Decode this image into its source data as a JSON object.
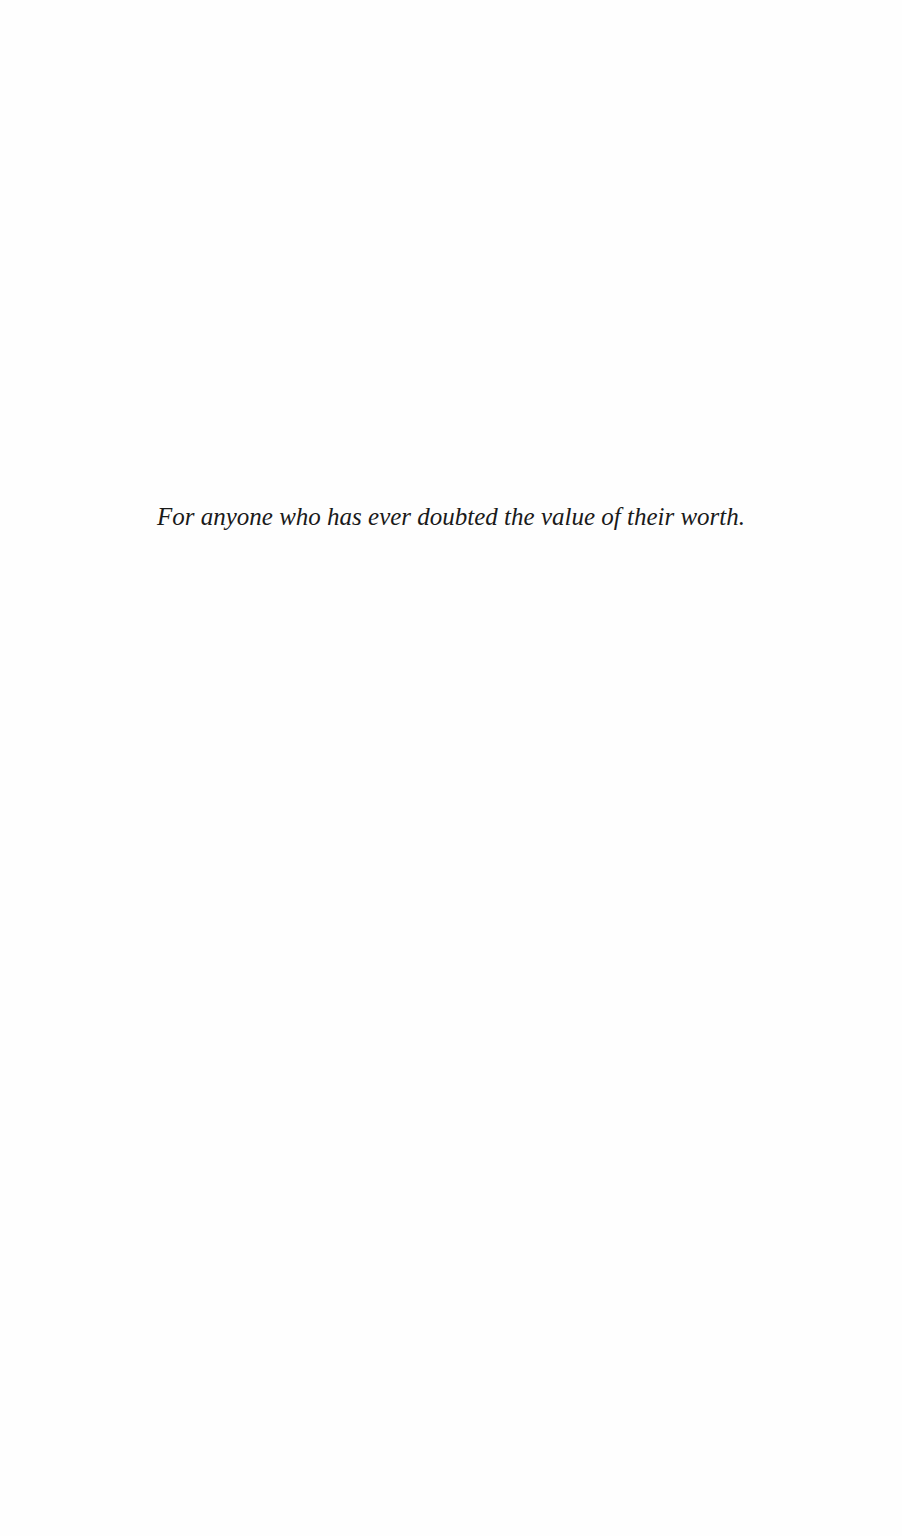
{
  "page": {
    "dedication": "For anyone who has ever doubted the value of their worth."
  }
}
